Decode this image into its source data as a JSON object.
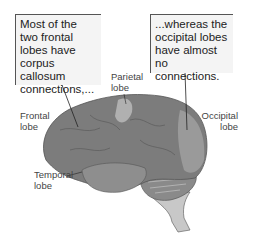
{
  "callouts": {
    "frontal": "Most of the two frontal lobes have corpus callosum connections,...",
    "occipital": "...whereas the occipital lobes have almost no connections."
  },
  "labels": {
    "frontal_1": "Frontal",
    "frontal_2": "lobe",
    "parietal_1": "Parietal",
    "parietal_2": "lobe",
    "occipital_1": "Occipital",
    "occipital_2": "lobe",
    "temporal_1": "Temporal",
    "temporal_2": "lobe"
  },
  "colors": {
    "brain": "#7a7a7a",
    "brain_light": "#a8a8a8",
    "callout_bg": "#f4f4f4",
    "callout_border": "#555555"
  }
}
